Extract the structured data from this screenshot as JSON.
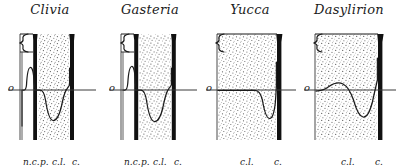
{
  "figure": {
    "background_color": "#ffffff",
    "ink_color": "#1b1b1b",
    "stipple_color": "#6b6b6b",
    "baseline_label": "o",
    "panel_count": 4
  },
  "panels": [
    {
      "id": "clivia",
      "title": "Clivia",
      "x": 0,
      "width": 100,
      "brace": true,
      "baseline_y": 62,
      "bars": [
        {
          "name": "inner-bar",
          "x": 32,
          "width": 6
        },
        {
          "name": "outer-bar",
          "x": 69,
          "width": 6
        }
      ],
      "stipple_region": {
        "x": 38,
        "width": 31
      },
      "left_rule_x": 20,
      "curve_peak": 1.0,
      "curve_trough": -1.0,
      "foot_labels": [
        {
          "text": "n.c.",
          "x": 23
        },
        {
          "text": "p.",
          "x": 40
        },
        {
          "text": "c.l.",
          "x": 52
        },
        {
          "text": "c.",
          "x": 72
        }
      ]
    },
    {
      "id": "gasteria",
      "title": "Gasteria",
      "x": 100,
      "width": 100,
      "brace": true,
      "baseline_y": 62,
      "bars": [
        {
          "name": "inner-bar",
          "x": 33,
          "width": 6
        },
        {
          "name": "outer-bar",
          "x": 71,
          "width": 6
        }
      ],
      "stipple_region": {
        "x": 39,
        "width": 32
      },
      "left_rule_x": 21,
      "curve_peak": 1.0,
      "curve_trough": -1.0,
      "foot_labels": [
        {
          "text": "n.c.",
          "x": 24
        },
        {
          "text": "p.",
          "x": 41
        },
        {
          "text": "c.l.",
          "x": 53
        },
        {
          "text": "c.",
          "x": 74
        }
      ]
    },
    {
      "id": "yucca",
      "title": "Yucca",
      "x": 200,
      "width": 100,
      "brace": true,
      "baseline_y": 62,
      "bars": [
        {
          "name": "outer-bar",
          "x": 76,
          "width": 7
        }
      ],
      "stipple_region": {
        "x": 18,
        "width": 58
      },
      "left_rule_x": 17,
      "curve_peak": 0.0,
      "curve_trough": -1.0,
      "foot_labels": [
        {
          "text": "c.l.",
          "x": 40
        },
        {
          "text": "c.",
          "x": 74
        }
      ]
    },
    {
      "id": "dasylirion",
      "title": "Dasylirion",
      "x": 299,
      "width": 100,
      "brace": true,
      "baseline_y": 62,
      "bars": [
        {
          "name": "outer-bar",
          "x": 78,
          "width": 7
        }
      ],
      "stipple_region": {
        "x": 17,
        "width": 61
      },
      "left_rule_x": 16,
      "curve_peak": 0.25,
      "curve_trough": -1.0,
      "foot_labels": [
        {
          "text": "c.l.",
          "x": 42
        },
        {
          "text": "c.",
          "x": 76
        }
      ]
    }
  ],
  "legend_keys": {
    "nc": "n.c.",
    "p": "p.",
    "cl": "c.l.",
    "c": "c.",
    "origin": "o"
  }
}
